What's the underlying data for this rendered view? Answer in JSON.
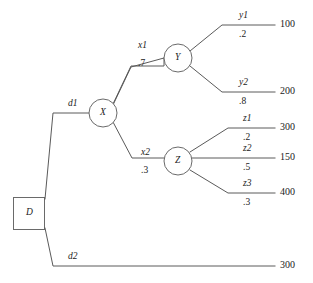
{
  "diagram": {
    "type": "decision-tree",
    "stroke_color": "#5a5a5a",
    "text_color": "#1b1b1b",
    "background_color": "#ffffff",
    "decision_node": {
      "label": "D",
      "shape": "square"
    },
    "chance_nodes": [
      {
        "id": "X",
        "label": "X",
        "shape": "circle"
      },
      {
        "id": "Y",
        "label": "Y",
        "shape": "circle"
      },
      {
        "id": "Z",
        "label": "Z",
        "shape": "circle"
      }
    ],
    "decision_branches": [
      {
        "id": "d1",
        "label": "d1"
      },
      {
        "id": "d2",
        "label": "d2"
      }
    ],
    "x_branches": [
      {
        "id": "x1",
        "label": "x1",
        "probability": ".7"
      },
      {
        "id": "x2",
        "label": "x2",
        "probability": ".3"
      }
    ],
    "y_branches": [
      {
        "id": "y1",
        "label": "y1",
        "probability": ".2",
        "payoff": "100"
      },
      {
        "id": "y2",
        "label": "y2",
        "probability": ".8",
        "payoff": "200"
      }
    ],
    "z_branches": [
      {
        "id": "z1",
        "label": "z1",
        "probability": ".2",
        "payoff": "300"
      },
      {
        "id": "z2",
        "label": "z2",
        "probability": ".5",
        "payoff": "150"
      },
      {
        "id": "z3",
        "label": "z3",
        "probability": ".3",
        "payoff": "400"
      }
    ],
    "d2_payoff": "300"
  }
}
